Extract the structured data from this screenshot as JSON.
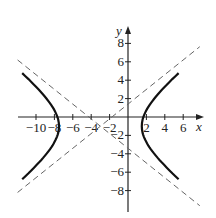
{
  "chart_data": {
    "type": "line",
    "title": "",
    "xlabel": "x",
    "ylabel": "y",
    "xlim": [
      -12,
      8
    ],
    "ylim": [
      -10,
      10
    ],
    "x_ticks": [
      -10,
      -8,
      -6,
      -4,
      -2,
      2,
      4,
      6
    ],
    "y_ticks": [
      -8,
      -6,
      -4,
      -2,
      2,
      4,
      6,
      8
    ],
    "x_tick_labels": [
      "−10",
      "−8",
      "−6",
      "−4",
      "−2",
      "2",
      "4",
      "6"
    ],
    "y_tick_labels": [
      "−8",
      "−6",
      "−4",
      "−2",
      "2",
      "4",
      "6",
      "8"
    ],
    "series": [
      {
        "name": "hyperbola",
        "style": "solid",
        "center": [
          -3,
          -1
        ],
        "a": 4.5,
        "b": 3.6,
        "vertices": [
          [
            -7.5,
            -1
          ],
          [
            1.5,
            -1
          ]
        ]
      },
      {
        "name": "asymptote-1",
        "style": "dashed",
        "slope": 0.8,
        "through": [
          -3,
          -1
        ]
      },
      {
        "name": "asymptote-2",
        "style": "dashed",
        "slope": -0.8,
        "through": [
          -3,
          -1
        ]
      }
    ],
    "grid": false
  }
}
